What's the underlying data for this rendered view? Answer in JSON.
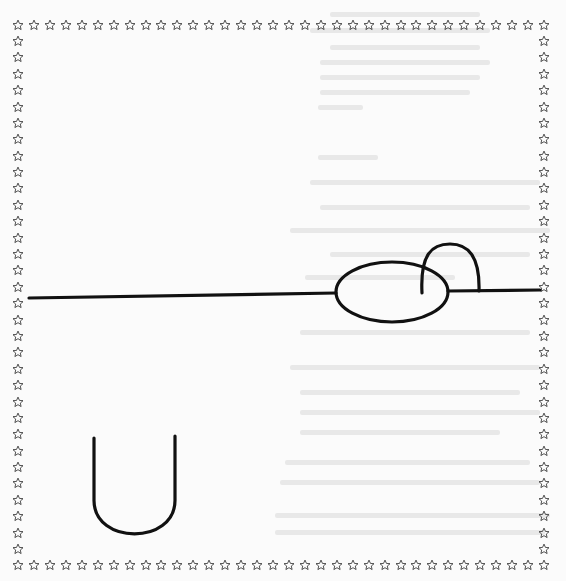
{
  "page": {
    "type": "tracing-worksheet",
    "background": "#fbfbfb",
    "ink_color": "#111111",
    "border": {
      "icon": "star-outline-icon",
      "glyph": "☆",
      "color": "#333333",
      "top_row": {
        "y": 25,
        "x_start": 18,
        "x_end": 544,
        "count": 34
      },
      "bottom_row": {
        "y": 565,
        "x_start": 18,
        "x_end": 544,
        "count": 34
      },
      "left_column": {
        "x": 18,
        "y_start": 41,
        "y_end": 549,
        "count": 32
      },
      "right_column": {
        "x": 544,
        "y_start": 41,
        "y_end": 549,
        "count": 32
      }
    },
    "strokes": {
      "horizontal_line_left": {
        "x1": 29,
        "y1": 298,
        "x2": 336,
        "y2": 293
      },
      "ellipse": {
        "cx": 392,
        "cy": 292,
        "rx": 56,
        "ry": 30
      },
      "horizontal_line_right": {
        "x1": 448,
        "y1": 291,
        "x2": 540,
        "y2": 290
      },
      "arch": {
        "start": [
          422,
          293
        ],
        "peak": [
          450,
          244
        ],
        "end": [
          479,
          291
        ]
      },
      "u_shape": {
        "left_x": 94,
        "right_x": 175,
        "top_left_y": 438,
        "top_right_y": 436,
        "bottom_y": 543
      }
    },
    "show_through_text": [
      {
        "x": 330,
        "y": 12,
        "w": 150
      },
      {
        "x": 310,
        "y": 28,
        "w": 180
      },
      {
        "x": 330,
        "y": 45,
        "w": 150
      },
      {
        "x": 320,
        "y": 60,
        "w": 170
      },
      {
        "x": 320,
        "y": 75,
        "w": 160
      },
      {
        "x": 320,
        "y": 90,
        "w": 150
      },
      {
        "x": 318,
        "y": 105,
        "w": 45
      },
      {
        "x": 318,
        "y": 155,
        "w": 60
      },
      {
        "x": 310,
        "y": 180,
        "w": 230
      },
      {
        "x": 320,
        "y": 205,
        "w": 210
      },
      {
        "x": 290,
        "y": 228,
        "w": 260
      },
      {
        "x": 330,
        "y": 252,
        "w": 200
      },
      {
        "x": 305,
        "y": 275,
        "w": 150
      },
      {
        "x": 300,
        "y": 330,
        "w": 230
      },
      {
        "x": 290,
        "y": 365,
        "w": 250
      },
      {
        "x": 300,
        "y": 390,
        "w": 220
      },
      {
        "x": 300,
        "y": 410,
        "w": 240
      },
      {
        "x": 300,
        "y": 430,
        "w": 200
      },
      {
        "x": 285,
        "y": 460,
        "w": 245
      },
      {
        "x": 280,
        "y": 480,
        "w": 260
      },
      {
        "x": 275,
        "y": 513,
        "w": 275
      },
      {
        "x": 275,
        "y": 530,
        "w": 270
      }
    ]
  }
}
